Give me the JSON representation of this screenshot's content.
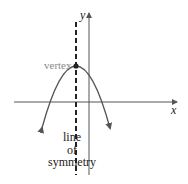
{
  "diagram": {
    "type": "parabola-line-of-symmetry",
    "labels": {
      "x_axis": "x",
      "y_axis": "y",
      "vertex": "vertex",
      "line_of_symmetry": [
        "line",
        "of",
        "symmetry"
      ]
    },
    "colors": {
      "axes": "#555555",
      "curve": "#555555",
      "symmetry_line": "#222222",
      "vertex_point": "#222222",
      "vertex_label": "#8a8a8a",
      "text": "#222222"
    },
    "geometry": {
      "parabola_opens": "down",
      "vertex_position": "second quadrant, above x-axis",
      "symmetry_line_style": "dashed vertical"
    }
  }
}
